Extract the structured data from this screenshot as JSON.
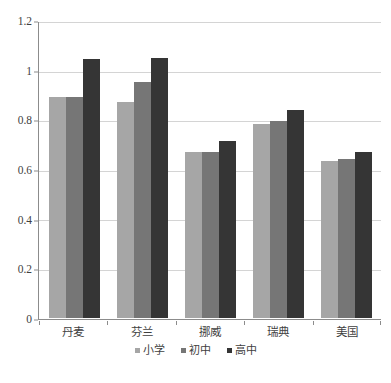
{
  "chart_data": {
    "type": "bar",
    "title": "",
    "subtitle": "",
    "xlabel": "",
    "ylabel": "",
    "categories": [
      "丹麦",
      "芬兰",
      "挪威",
      "瑞典",
      "美国"
    ],
    "series": [
      {
        "name": "小学",
        "color": "#a6a6a6",
        "values": [
          0.895,
          0.875,
          0.672,
          0.788,
          0.638
        ]
      },
      {
        "name": "初中",
        "color": "#767676",
        "values": [
          0.895,
          0.955,
          0.673,
          0.798,
          0.645
        ]
      },
      {
        "name": "高中",
        "color": "#353535",
        "values": [
          1.05,
          1.055,
          0.718,
          0.845,
          0.675
        ]
      }
    ],
    "ylim": [
      0,
      1.2
    ],
    "yticks": [
      0,
      0.2,
      0.4,
      0.6,
      0.8,
      1,
      1.2
    ],
    "ytick_labels": [
      "0",
      "0.2",
      "0.4",
      "0.6",
      "0.8",
      "1",
      "1.2"
    ],
    "grid": true,
    "grid_axis": "y",
    "legend": true,
    "legend_position": "bottom",
    "legend_marker": "square",
    "colors": {
      "grid": "#d4d4d4",
      "axis": "#8c8c8c",
      "text": "#3f3f3f",
      "background": "#ffffff"
    }
  },
  "caption": {
    "cropped_text": ""
  }
}
